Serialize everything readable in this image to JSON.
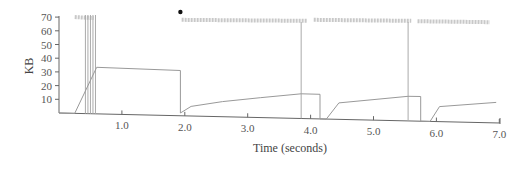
{
  "chart_data": {
    "type": "line",
    "title": "",
    "xlabel": "Time (seconds)",
    "ylabel": "KB",
    "xlim": [
      0,
      7.0
    ],
    "ylim": [
      0,
      70
    ],
    "x_ticks": [
      "1.0",
      "2.0",
      "3.0",
      "4.0",
      "5.0",
      "6.0",
      "7.0"
    ],
    "y_ticks": [
      "10",
      "20",
      "30",
      "40",
      "50",
      "60",
      "70"
    ],
    "grid": false,
    "legend": null,
    "series": [
      {
        "name": "congestion window",
        "points": [
          [
            0,
            0
          ],
          [
            0.25,
            0
          ],
          [
            0.6,
            34
          ],
          [
            1.93,
            33
          ],
          [
            1.93,
            2
          ],
          [
            2.1,
            7
          ],
          [
            2.6,
            11
          ],
          [
            3.2,
            14.5
          ],
          [
            3.85,
            18
          ],
          [
            3.85,
            18
          ],
          [
            4.15,
            18
          ],
          [
            4.15,
            0
          ],
          [
            4.25,
            0
          ],
          [
            4.45,
            12
          ],
          [
            5.55,
            18
          ],
          [
            5.55,
            18
          ],
          [
            5.75,
            18
          ],
          [
            5.75,
            0
          ],
          [
            5.9,
            0
          ],
          [
            6.05,
            11
          ],
          [
            6.95,
            15
          ]
        ]
      }
    ],
    "annotations": {
      "packet_marks_rows": [
        {
          "x_start": 0.25,
          "x_end": 0.55,
          "y": 70
        },
        {
          "x_start": 1.95,
          "x_end": 3.95,
          "y": 68
        },
        {
          "x_start": 4.05,
          "x_end": 5.6,
          "y": 68
        },
        {
          "x_start": 5.7,
          "x_end": 6.85,
          "y": 67
        }
      ],
      "timeout_vertical_lines_x": [
        0.42,
        0.46,
        0.5,
        0.54,
        0.58,
        3.85,
        5.55
      ],
      "dot": {
        "x": 1.93,
        "y": 74
      }
    }
  }
}
